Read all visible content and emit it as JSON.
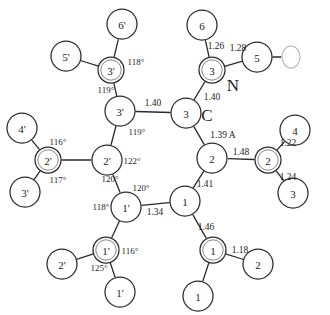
{
  "diagram": {
    "unit_note": "1.39 A",
    "canvas": {
      "width": 330,
      "height": 315
    },
    "colors": {
      "background": "#ffffff",
      "stroke": "#2b2b2b",
      "inner_ring": "#7a7a7a",
      "text": "#1c1c1c",
      "faint": "#b4b4b4"
    }
  },
  "atoms": [
    {
      "id": "ring-3p",
      "label": "3'",
      "x": 120,
      "y": 111,
      "r": 15,
      "double": false
    },
    {
      "id": "ring-3",
      "label": "3",
      "x": 186,
      "y": 113,
      "r": 15,
      "double": false
    },
    {
      "id": "ring-2p",
      "label": "2'",
      "x": 107,
      "y": 160,
      "r": 15,
      "double": false
    },
    {
      "id": "ring-2",
      "label": "2",
      "x": 212,
      "y": 158,
      "r": 15,
      "double": false
    },
    {
      "id": "ring-1p",
      "label": "1'",
      "x": 126,
      "y": 207,
      "r": 15,
      "double": false
    },
    {
      "id": "ring-1",
      "label": "1",
      "x": 185,
      "y": 201,
      "r": 15,
      "double": false
    },
    {
      "id": "sub-3p",
      "label": "3'",
      "x": 111,
      "y": 70,
      "r": 13,
      "double": true
    },
    {
      "id": "sub-6p",
      "label": "6'",
      "x": 122,
      "y": 24,
      "r": 15,
      "double": false
    },
    {
      "id": "sub-5p",
      "label": "5'",
      "x": 66,
      "y": 56,
      "r": 15,
      "double": false
    },
    {
      "id": "sub-3",
      "label": "3",
      "x": 212,
      "y": 70,
      "r": 13,
      "double": true
    },
    {
      "id": "sub-6",
      "label": "6",
      "x": 202,
      "y": 25,
      "r": 15,
      "double": false
    },
    {
      "id": "sub-5",
      "label": "5",
      "x": 257,
      "y": 57,
      "r": 15,
      "double": false
    },
    {
      "id": "sub-2p",
      "label": "2'",
      "x": 48,
      "y": 160,
      "r": 13,
      "double": true
    },
    {
      "id": "sub-4p",
      "label": "4'",
      "x": 22,
      "y": 128,
      "r": 15,
      "double": false
    },
    {
      "id": "sub-3pb",
      "label": "3'",
      "x": 25,
      "y": 192,
      "r": 15,
      "double": false
    },
    {
      "id": "sub-2",
      "label": "2",
      "x": 268,
      "y": 160,
      "r": 13,
      "double": true
    },
    {
      "id": "sub-4",
      "label": "4",
      "x": 295,
      "y": 130,
      "r": 15,
      "double": false
    },
    {
      "id": "sub-3b",
      "label": "3",
      "x": 293,
      "y": 193,
      "r": 15,
      "double": false
    },
    {
      "id": "sub-1p",
      "label": "1'",
      "x": 106,
      "y": 250,
      "r": 13,
      "double": true
    },
    {
      "id": "sub-2pb",
      "label": "2'",
      "x": 62,
      "y": 264,
      "r": 15,
      "double": false
    },
    {
      "id": "sub-1pb",
      "label": "1'",
      "x": 120,
      "y": 292,
      "r": 15,
      "double": false
    },
    {
      "id": "sub-1",
      "label": "1",
      "x": 213,
      "y": 250,
      "r": 13,
      "double": true
    },
    {
      "id": "sub-2b",
      "label": "2",
      "x": 258,
      "y": 264,
      "r": 15,
      "double": false
    },
    {
      "id": "sub-1b",
      "label": "1",
      "x": 198,
      "y": 296,
      "r": 15,
      "double": false
    }
  ],
  "bonds": [
    {
      "from": "ring-3p",
      "to": "ring-3"
    },
    {
      "from": "ring-3p",
      "to": "ring-2p"
    },
    {
      "from": "ring-2p",
      "to": "ring-1p"
    },
    {
      "from": "ring-1p",
      "to": "ring-1"
    },
    {
      "from": "ring-1",
      "to": "ring-2"
    },
    {
      "from": "ring-2",
      "to": "ring-3"
    },
    {
      "from": "ring-3p",
      "to": "sub-3p"
    },
    {
      "from": "sub-3p",
      "to": "sub-6p"
    },
    {
      "from": "sub-3p",
      "to": "sub-5p"
    },
    {
      "from": "ring-3",
      "to": "sub-3"
    },
    {
      "from": "sub-3",
      "to": "sub-6"
    },
    {
      "from": "sub-3",
      "to": "sub-5"
    },
    {
      "from": "ring-2p",
      "to": "sub-2p"
    },
    {
      "from": "sub-2p",
      "to": "sub-4p"
    },
    {
      "from": "sub-2p",
      "to": "sub-3pb"
    },
    {
      "from": "ring-2",
      "to": "sub-2"
    },
    {
      "from": "sub-2",
      "to": "sub-4"
    },
    {
      "from": "sub-2",
      "to": "sub-3b"
    },
    {
      "from": "ring-1p",
      "to": "sub-1p"
    },
    {
      "from": "sub-1p",
      "to": "sub-2pb"
    },
    {
      "from": "sub-1p",
      "to": "sub-1pb"
    },
    {
      "from": "ring-1",
      "to": "sub-1"
    },
    {
      "from": "sub-1",
      "to": "sub-2b"
    },
    {
      "from": "sub-1",
      "to": "sub-1b"
    },
    {
      "from": "sub-5",
      "to": "oval-o"
    }
  ],
  "bond_labels": [
    {
      "id": "bl-1",
      "text": "1.40",
      "x": 153,
      "y": 103
    },
    {
      "id": "bl-2",
      "text": "1.40",
      "x": 212,
      "y": 97
    },
    {
      "id": "bl-3",
      "text": "1.26",
      "x": 216,
      "y": 46
    },
    {
      "id": "bl-4",
      "text": "1.28",
      "x": 238,
      "y": 48
    },
    {
      "id": "bl-5",
      "text": "1.39 A",
      "x": 223,
      "y": 135
    },
    {
      "id": "bl-6",
      "text": "1.48",
      "x": 241,
      "y": 152
    },
    {
      "id": "bl-7",
      "text": "1.22",
      "x": 288,
      "y": 143
    },
    {
      "id": "bl-8",
      "text": "1.24",
      "x": 288,
      "y": 177
    },
    {
      "id": "bl-9",
      "text": "1.41",
      "x": 205,
      "y": 184
    },
    {
      "id": "bl-10",
      "text": "1.34",
      "x": 155,
      "y": 212
    },
    {
      "id": "bl-11",
      "text": "1.46",
      "x": 206,
      "y": 227
    },
    {
      "id": "bl-12",
      "text": "1.18",
      "x": 240,
      "y": 250
    }
  ],
  "angle_labels": [
    {
      "id": "ag-1",
      "text": "118°",
      "x": 136,
      "y": 62
    },
    {
      "id": "ag-2",
      "text": "119°",
      "x": 106,
      "y": 90
    },
    {
      "id": "ag-3",
      "text": "119°",
      "x": 137,
      "y": 132
    },
    {
      "id": "ag-4",
      "text": "122°",
      "x": 132,
      "y": 161
    },
    {
      "id": "ag-5",
      "text": "120°",
      "x": 110,
      "y": 179
    },
    {
      "id": "ag-6",
      "text": "120°",
      "x": 141,
      "y": 188
    },
    {
      "id": "ag-7",
      "text": "118°",
      "x": 101,
      "y": 207
    },
    {
      "id": "ag-8",
      "text": "116°",
      "x": 58,
      "y": 142
    },
    {
      "id": "ag-9",
      "text": "117°",
      "x": 58,
      "y": 180
    },
    {
      "id": "ag-10",
      "text": "116°",
      "x": 130,
      "y": 251
    },
    {
      "id": "ag-11",
      "text": "125°",
      "x": 99,
      "y": 268
    }
  ],
  "element_labels": [
    {
      "id": "el-n",
      "text": "N",
      "x": 233,
      "y": 85
    },
    {
      "id": "el-c",
      "text": "C",
      "x": 207,
      "y": 115
    }
  ],
  "oval": {
    "id": "oval-o",
    "cx": 291,
    "cy": 57,
    "rx": 9,
    "ry": 11
  }
}
